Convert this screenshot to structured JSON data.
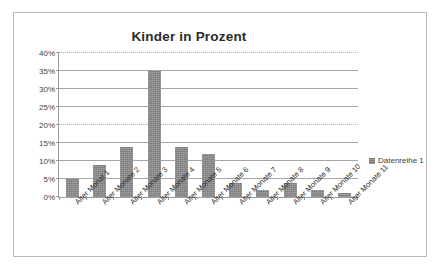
{
  "chart_data": {
    "type": "bar",
    "title": "Kinder in Prozent",
    "xlabel": "",
    "ylabel": "",
    "ylim": [
      0,
      40
    ],
    "ytick_labels": [
      "0%",
      "5%",
      "10%",
      "15%",
      "20%",
      "25%",
      "30%",
      "35%",
      "40%"
    ],
    "ytick_values": [
      0,
      5,
      10,
      15,
      20,
      25,
      30,
      35,
      40
    ],
    "grid": true,
    "legend_position": "right",
    "categories": [
      "Alter Monat 1",
      "Alter Monate 2",
      "Alter Monate 3",
      "Alter Monate 4",
      "Alter Monate 5",
      "Alter Monate 6",
      "Alter Monate 7",
      "Alter Monate 8",
      "Alter Monate 9",
      "Alter Monate 10",
      "Alter Monate 11"
    ],
    "series": [
      {
        "name": "Datenreihe 1",
        "color": "#7d7d7d",
        "values": [
          5,
          9,
          14,
          35,
          14,
          12,
          4,
          2,
          4,
          2,
          1
        ]
      }
    ]
  },
  "legend": {
    "entry_label": "Datenreihe 1"
  },
  "colors": {
    "bar": "#7d7d7d",
    "gridline": "#a6a6a6",
    "axis": "#9a9a9a",
    "frame_border": "#b9b9b9",
    "title_text": "#2b2b2b",
    "tick_text": "#3d3d3d"
  }
}
